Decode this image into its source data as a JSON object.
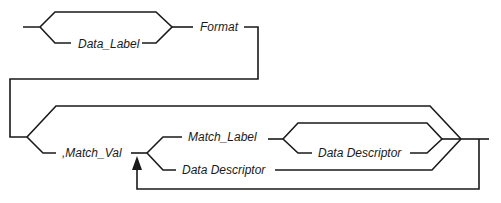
{
  "diagram": {
    "type": "syntax-railroad",
    "colors": {
      "line": "#1a1a1a",
      "background": "#ffffff"
    },
    "labels": {
      "data_label": "Data_Label",
      "format": "Format",
      "match_val": ",Match_Val",
      "match_label": "Match_Label",
      "inner_data_descriptor": "Data Descriptor",
      "data_descriptor": "Data Descriptor"
    }
  }
}
